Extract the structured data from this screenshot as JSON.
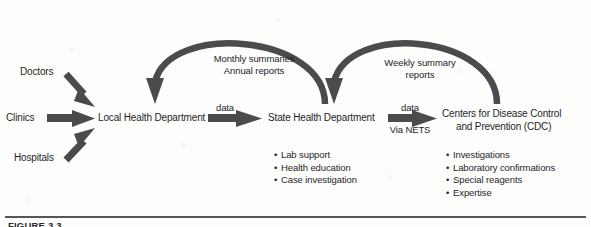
{
  "figure": {
    "caption": "FIGURE 3.3",
    "ink_color": "#4b4b4d",
    "text_color": "#1f1f1f",
    "rule_color": "#55555a"
  },
  "nodes": {
    "doctors": "Doctors",
    "clinics": "Clinics",
    "hospitals": "Hospitals",
    "local_health_department": "Local Health Department",
    "state_health_department": "State Health Department",
    "cdc_line1": "Centers for Disease Control",
    "cdc_line2": "and Prevention (CDC)"
  },
  "edges": {
    "data_1": "data",
    "data_2": "data",
    "via_nets": "Via NETS",
    "curve_1_line1": "Monthly summaries",
    "curve_1_line2": "Annual reports",
    "curve_2_line1": "Weekly summary",
    "curve_2_line2": "reports"
  },
  "services": {
    "state_health_department": [
      "Lab support",
      "Health education",
      "Case investigation"
    ],
    "cdc": [
      "Investigations",
      "Laboratory confirmations",
      "Special reagents",
      "Expertise"
    ]
  },
  "bullet_glyph": "•"
}
